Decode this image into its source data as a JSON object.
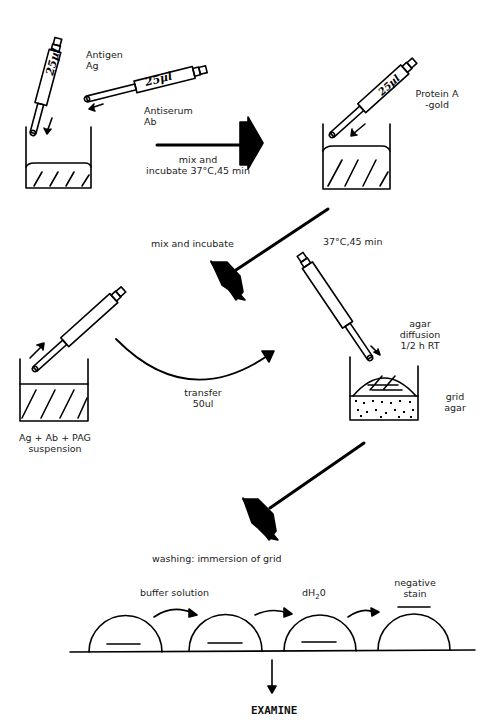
{
  "diagram": {
    "type": "procedure-flow",
    "steps": [
      {
        "id": "step1",
        "labels": [
          "Antigen",
          "Ag"
        ],
        "pipette_volume": "25µl"
      },
      {
        "id": "step1b",
        "labels": [
          "Antiserum",
          "Ab"
        ],
        "pipette_volume": "25µl"
      },
      {
        "id": "arrow1",
        "labels": [
          "mix and",
          "incubate 37°C,45 min"
        ]
      },
      {
        "id": "step2",
        "labels": [
          "Protein A",
          "-gold"
        ],
        "pipette_volume": "25µl"
      },
      {
        "id": "arrow2",
        "labels": [
          "mix and incubate"
        ]
      },
      {
        "id": "step3",
        "labels": [
          "Ag + Ab + PAG",
          "suspension"
        ]
      },
      {
        "id": "arrow3",
        "labels": [
          "transfer",
          "50ul"
        ]
      },
      {
        "id": "step4",
        "labels": [
          "37°C,45 min"
        ],
        "notes": [
          "agar",
          "diffusion",
          "1/2 h  RT"
        ],
        "side_labels": [
          "grid",
          "agar"
        ]
      },
      {
        "id": "arrow4",
        "labels": [
          "washing: immersion of grid"
        ]
      },
      {
        "id": "wash",
        "labels": [
          "buffer solution",
          "dH₂0",
          "negative",
          "stain"
        ]
      },
      {
        "id": "final",
        "labels": [
          "EXAMINE"
        ]
      }
    ]
  },
  "text": {
    "antigen": "Antigen",
    "ag": "Ag",
    "antiserum": "Antiserum",
    "ab": "Ab",
    "vol1": "25µl",
    "vol2": "25µl",
    "vol3": "25µl",
    "mix1": "mix and",
    "mix2": "incubate 37°C,45 min",
    "proteinA": "Protein A",
    "gold": "-gold",
    "mix_incubate": "mix and incubate",
    "temp_time": "37°C,45 min",
    "agar1": "agar",
    "agar2": "diffusion",
    "agar3": "1/2 h  RT",
    "grid": "grid",
    "agar": "agar",
    "transfer": "transfer",
    "transfer_vol": "50ul",
    "suspension1": "Ag + Ab + PAG",
    "suspension2": "suspension",
    "washing": "washing: immersion of grid",
    "buffer": "buffer solution",
    "dh2o_d": "dH",
    "dh2o_sub": "2",
    "dh2o_o": "0",
    "neg1": "negative",
    "neg2": "stain",
    "examine": "EXAMINE"
  }
}
